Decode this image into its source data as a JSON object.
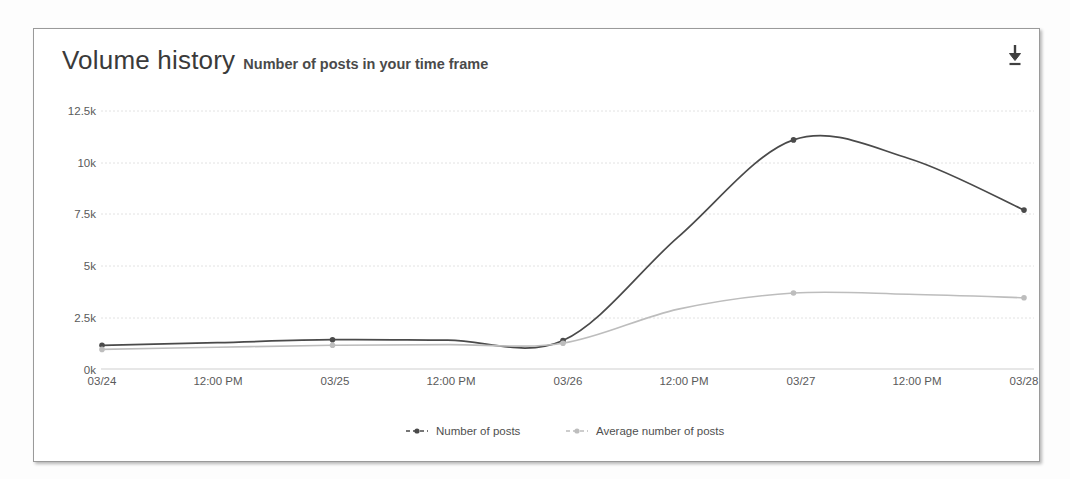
{
  "card": {
    "title": "Volume history",
    "subtitle": "Number of posts in your time frame",
    "download_icon": "download-icon"
  },
  "chart_data": {
    "type": "line",
    "title": "Volume history",
    "subtitle": "Number of posts in your time frame",
    "xlabel": "",
    "ylabel": "",
    "ylim": [
      0,
      12500
    ],
    "yticks": [
      0,
      2500,
      5000,
      7500,
      10000,
      12500
    ],
    "ytick_labels": [
      "0k",
      "2.5k",
      "5k",
      "7.5k",
      "10k",
      "12.5k"
    ],
    "x": [
      "03/24",
      "12:00 PM",
      "03/25",
      "12:00 PM",
      "03/26",
      "12:00 PM",
      "03/27",
      "12:00 PM",
      "03/28"
    ],
    "xtick_labels": [
      "03/24",
      "12:00 PM",
      "03/25",
      "12:00 PM",
      "03/26",
      "12:00 PM",
      "03/27",
      "12:00 PM",
      "03/28"
    ],
    "grid": true,
    "legend_position": "bottom",
    "series": [
      {
        "name": "Number of posts",
        "color": "#4a4a4a",
        "values": [
          1150,
          1280,
          1420,
          1400,
          1380,
          6400,
          11100,
          10200,
          7700
        ]
      },
      {
        "name": "Average number of posts",
        "color": "#bdbdbd",
        "values": [
          950,
          1050,
          1150,
          1180,
          1250,
          2900,
          3680,
          3620,
          3450
        ]
      }
    ]
  },
  "legend": [
    {
      "label": "Number of posts",
      "color": "#4a4a4a"
    },
    {
      "label": "Average number of posts",
      "color": "#bdbdbd"
    }
  ]
}
